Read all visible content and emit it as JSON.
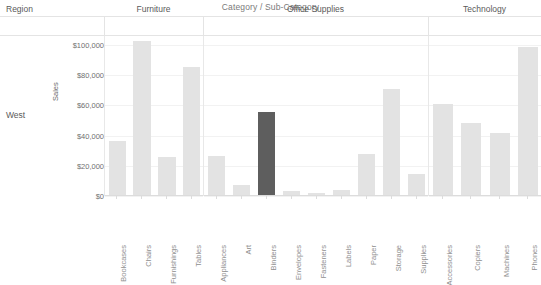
{
  "chart_title": "Category / Sub-Category",
  "header": {
    "region_label": "Region",
    "panels": [
      "Furniture",
      "Office Supplies",
      "Technology"
    ]
  },
  "row": {
    "label": "West"
  },
  "axis": {
    "y_title": "Sales",
    "y_ticks": [
      "$100,000",
      "$80,000",
      "$60,000",
      "$40,000",
      "$20,000",
      "$0"
    ],
    "y_tick_values": [
      100000,
      80000,
      60000,
      40000,
      20000,
      0
    ]
  },
  "colors": {
    "bar": "#e3e3e3",
    "bar_selected": "#5e5e5e",
    "grid": "#f2f2f2",
    "axis": "#dcdcdc",
    "text": "#6b6b6b"
  },
  "chart_data": {
    "type": "bar",
    "title": "Category / Sub-Category",
    "xlabel": "",
    "ylabel": "Sales",
    "ylim": [
      0,
      110000
    ],
    "grid": true,
    "legend": "none",
    "row_dimension": "Region",
    "row_value": "West",
    "panels": [
      {
        "name": "Furniture",
        "categories": [
          "Bookcases",
          "Chairs",
          "Furnishings",
          "Tables"
        ],
        "values": [
          36000,
          102000,
          25000,
          85000
        ],
        "selected": []
      },
      {
        "name": "Office Supplies",
        "categories": [
          "Appliances",
          "Art",
          "Binders",
          "Envelopes",
          "Fasteners",
          "Labels",
          "Paper",
          "Storage",
          "Supplies"
        ],
        "values": [
          26000,
          6500,
          55000,
          2500,
          1200,
          3000,
          27000,
          70000,
          14000
        ],
        "selected": [
          "Binders"
        ]
      },
      {
        "name": "Technology",
        "categories": [
          "Accessories",
          "Copiers",
          "Machines",
          "Phones"
        ],
        "values": [
          60000,
          48000,
          41000,
          98000
        ],
        "selected": []
      }
    ]
  }
}
